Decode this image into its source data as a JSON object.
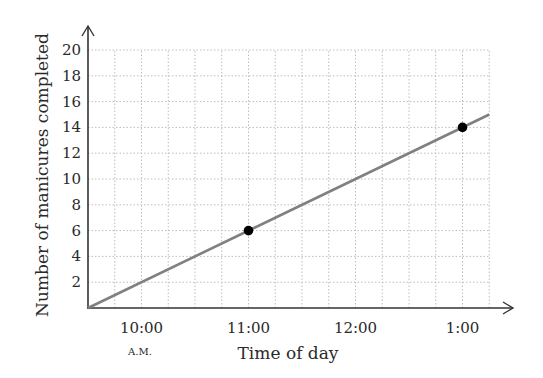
{
  "chart_data": {
    "type": "line",
    "title": "",
    "xlabel": "Time of day",
    "ylabel": "Number of manicures completed",
    "x_ticks": [
      "10:00",
      "11:00",
      "12:00",
      "1:00"
    ],
    "x_tick_sublabel": {
      "10:00": "A.M."
    },
    "y_ticks": [
      2,
      4,
      6,
      8,
      10,
      12,
      14,
      16,
      18,
      20
    ],
    "ylim": [
      0,
      20
    ],
    "xlim_hours_after_9_30": [
      0,
      3.75
    ],
    "grid": true,
    "grid_style": "dotted",
    "series": [
      {
        "name": "manicures",
        "line": {
          "x": [
            "9:30",
            "1:15"
          ],
          "y": [
            0,
            15
          ]
        },
        "points": [
          {
            "x": "11:00",
            "y": 6
          },
          {
            "x": "1:00",
            "y": 14
          }
        ],
        "color": "#808080"
      }
    ],
    "colors": {
      "line": "#808080",
      "points": "#000000",
      "axes": "#333333",
      "grid": "#bdbdbd"
    }
  },
  "labels": {
    "xlabel": "Time of day",
    "ylabel": "Number of manicures completed",
    "am": "A.M."
  }
}
